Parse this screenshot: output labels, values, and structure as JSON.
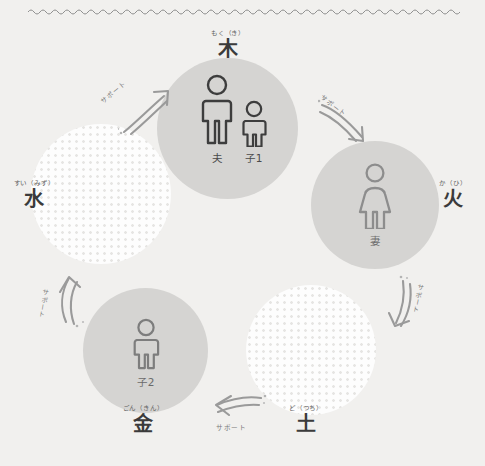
{
  "diagram": {
    "title_divider": "wavy-rule",
    "background_color": "#f1f0ee",
    "solid_circle_color": "#d5d4d2",
    "dotted_circle_color": "#fdfdfd",
    "dot_color": "#e6e5e3",
    "figure_stroke_dark": "#3d3d3d",
    "figure_stroke_light": "#8d8d8d"
  },
  "elements": [
    {
      "id": "wood",
      "furigana": "もく（き）",
      "kanji": "木"
    },
    {
      "id": "fire",
      "furigana": "か（ひ）",
      "kanji": "火"
    },
    {
      "id": "earth",
      "furigana": "ど（つち）",
      "kanji": "土"
    },
    {
      "id": "metal",
      "furigana": "ごん（きん）",
      "kanji": "金"
    },
    {
      "id": "water",
      "furigana": "すい（みず）",
      "kanji": "水"
    }
  ],
  "people": [
    {
      "id": "husband",
      "label": "夫",
      "element": "wood"
    },
    {
      "id": "child1",
      "label": "子1",
      "element": "wood"
    },
    {
      "id": "wife",
      "label": "妻",
      "element": "fire"
    },
    {
      "id": "child2",
      "label": "子2",
      "element": "metal"
    }
  ],
  "arrows": [
    {
      "id": "water-to-wood",
      "label": "サポート",
      "direction": "up-right"
    },
    {
      "id": "wood-to-fire",
      "label": "サポート",
      "direction": "down-right"
    },
    {
      "id": "fire-to-earth",
      "label": "サポート",
      "direction": "down"
    },
    {
      "id": "earth-to-metal",
      "label": "サポート",
      "direction": "left"
    },
    {
      "id": "metal-to-water",
      "label": "サポート",
      "direction": "up"
    }
  ]
}
